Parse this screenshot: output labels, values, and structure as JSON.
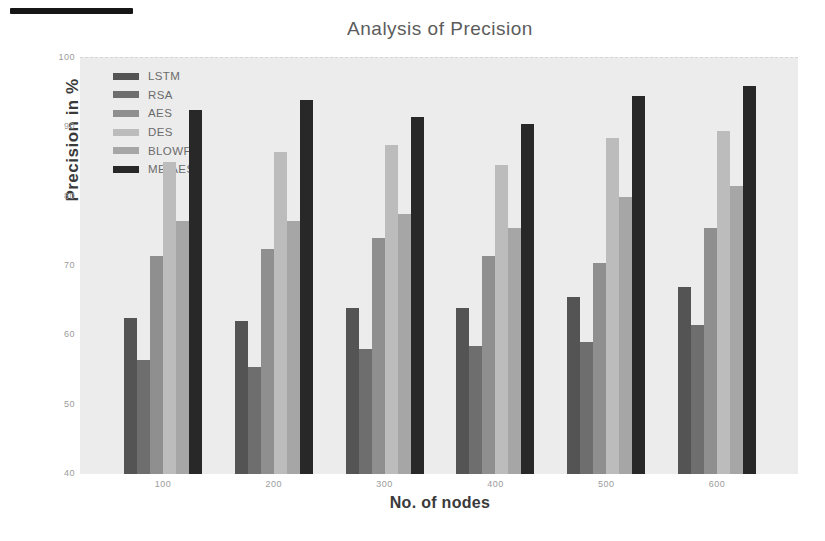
{
  "figure": {
    "page_background": "#ffffff",
    "plot_background": "#ececec",
    "artifact_bar_color": "#161616",
    "title_color": "#5c5c5c",
    "axis_label_color": "#3a3a3a",
    "tick_color": "#9b9b9b",
    "legend_text_color": "#6b6b6b"
  },
  "chart_data": {
    "type": "bar",
    "title": "Analysis of Precision",
    "xlabel": "No. of nodes",
    "ylabel": "Precision in %",
    "categories": [
      "100",
      "200",
      "300",
      "400",
      "500",
      "600"
    ],
    "series": [
      {
        "name": "LSTM",
        "color": "#545454",
        "values": [
          62.5,
          62,
          64,
          64,
          65.5,
          67
        ]
      },
      {
        "name": "RSA",
        "color": "#6e6e6e",
        "values": [
          56.5,
          55.5,
          58,
          58.5,
          59,
          61.5
        ]
      },
      {
        "name": "AES",
        "color": "#8f8f8f",
        "values": [
          71.5,
          72.5,
          74,
          71.5,
          70.5,
          75.5
        ]
      },
      {
        "name": "DES",
        "color": "#bcbcbc",
        "values": [
          85,
          86.5,
          87.5,
          84.5,
          88.5,
          89.5
        ]
      },
      {
        "name": "BLOWFIS",
        "color": "#a6a6a6",
        "values": [
          76.5,
          76.5,
          77.5,
          75.5,
          80,
          81.5
        ]
      },
      {
        "name": "ME-AES",
        "color": "#282828",
        "values": [
          92.5,
          94,
          91.5,
          90.5,
          94.5,
          96
        ]
      }
    ],
    "ylim": [
      40,
      100
    ],
    "yticks": [
      100,
      90,
      80,
      70,
      60,
      50,
      40
    ],
    "grid": false,
    "legend_position": "upper-left"
  }
}
